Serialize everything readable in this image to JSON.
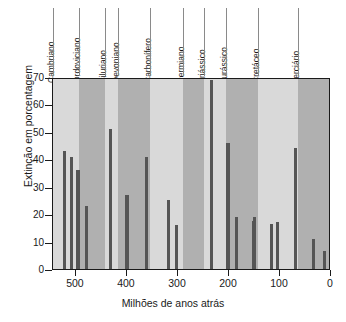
{
  "chart_data": {
    "type": "bar",
    "title": "",
    "xlabel": "Milhões de anos atrás",
    "ylabel": "Extinção em porcentagem",
    "xlim": [
      545,
      0
    ],
    "ylim": [
      0,
      70
    ],
    "x_reversed": true,
    "grid": false,
    "legend": "none",
    "xticks": [
      500,
      400,
      300,
      200,
      100,
      0
    ],
    "yticks": [
      0,
      10,
      20,
      30,
      40,
      50,
      60,
      70
    ],
    "bar_color": "#555555",
    "band_colors": [
      "#d9d9d9",
      "#b0b0b0"
    ],
    "x": [
      522,
      508,
      496,
      479,
      433,
      400,
      362,
      318,
      303,
      235,
      202,
      186,
      152,
      150,
      117,
      105,
      70,
      35,
      13
    ],
    "values": [
      43,
      41,
      36,
      23,
      51,
      27,
      41,
      25,
      16,
      69,
      46,
      19,
      17.5,
      19,
      16.5,
      17,
      44,
      11,
      6.5
    ],
    "series": [
      {
        "name": "Extinção de famílias marinhas",
        "points": [
          {
            "age": 522,
            "value": 43
          },
          {
            "age": 508,
            "value": 41
          },
          {
            "age": 496,
            "value": 36
          },
          {
            "age": 479,
            "value": 23
          },
          {
            "age": 433,
            "value": 51
          },
          {
            "age": 400,
            "value": 27
          },
          {
            "age": 362,
            "value": 41
          },
          {
            "age": 318,
            "value": 25
          },
          {
            "age": 303,
            "value": 16
          },
          {
            "age": 235,
            "value": 69
          },
          {
            "age": 202,
            "value": 46
          },
          {
            "age": 186,
            "value": 19
          },
          {
            "age": 152,
            "value": 17.5
          },
          {
            "age": 150,
            "value": 19
          },
          {
            "age": 117,
            "value": 16.5
          },
          {
            "age": 105,
            "value": 17
          },
          {
            "age": 70,
            "value": 44
          },
          {
            "age": 35,
            "value": 11
          },
          {
            "age": 13,
            "value": 6.5
          }
        ]
      }
    ],
    "periods": [
      {
        "label": "Cambriano",
        "start": 545,
        "end": 495,
        "shade": 0
      },
      {
        "label": "Ordoviciano",
        "start": 495,
        "end": 443,
        "shade": 1
      },
      {
        "label": "Siluriano",
        "start": 443,
        "end": 417,
        "shade": 0
      },
      {
        "label": "Devoniano",
        "start": 417,
        "end": 354,
        "shade": 1
      },
      {
        "label": "Carbonífero",
        "start": 354,
        "end": 290,
        "shade": 0
      },
      {
        "label": "Permiano",
        "start": 290,
        "end": 248,
        "shade": 1
      },
      {
        "label": "Triássico",
        "start": 248,
        "end": 206,
        "shade": 0
      },
      {
        "label": "Jurássico",
        "start": 206,
        "end": 144,
        "shade": 1
      },
      {
        "label": "Cretáceo",
        "start": 144,
        "end": 65,
        "shade": 0
      },
      {
        "label": "Terciário",
        "start": 65,
        "end": 0,
        "shade": 1
      }
    ]
  }
}
